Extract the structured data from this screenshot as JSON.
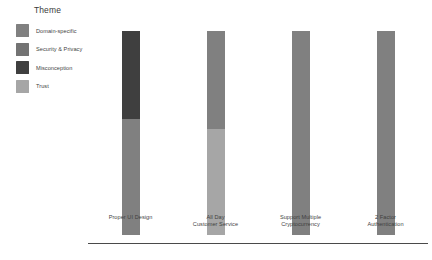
{
  "legend": {
    "title": "Theme",
    "items": [
      {
        "label": "Domain-specific",
        "color": "#808080"
      },
      {
        "label": "Security & Privacy",
        "color": "#737373"
      },
      {
        "label": "Misconception",
        "color": "#3f3f3f"
      },
      {
        "label": "Trust",
        "color": "#a6a6a6"
      }
    ]
  },
  "axis": {
    "line_color": "#4a4a4a"
  },
  "chart_data": {
    "type": "bar",
    "title": "",
    "xlabel": "",
    "ylabel": "",
    "stacked": true,
    "normalized": true,
    "grid": false,
    "legend_position": "top-left",
    "ylim": [
      0,
      100
    ],
    "categories": [
      "Proper UI Design",
      "All Day Customer Service",
      "Support Multiple Cryptocurrency",
      "2 Factor Authentication"
    ],
    "category_lines": [
      [
        "Proper UI Design"
      ],
      [
        "All Day",
        "Customer Service"
      ],
      [
        "Support Multiple",
        "Cryptocurrency"
      ],
      [
        "2 Factor",
        "Authentication"
      ]
    ],
    "series": [
      {
        "name": "Misconception",
        "color": "#3f3f3f",
        "values": [
          43,
          0,
          0,
          0
        ]
      },
      {
        "name": "Domain-specific",
        "color": "#808080",
        "values": [
          57,
          48,
          100,
          100
        ]
      },
      {
        "name": "Trust",
        "color": "#a6a6a6",
        "values": [
          0,
          52,
          0,
          0
        ]
      },
      {
        "name": "Security & Privacy",
        "color": "#737373",
        "values": [
          0,
          0,
          0,
          0
        ]
      }
    ],
    "bars": [
      {
        "category": "Proper UI Design",
        "segments": [
          {
            "theme": "Misconception",
            "value": 43,
            "color": "#3f3f3f"
          },
          {
            "theme": "Domain-specific",
            "value": 57,
            "color": "#808080"
          }
        ]
      },
      {
        "category": "All Day Customer Service",
        "segments": [
          {
            "theme": "Domain-specific",
            "value": 48,
            "color": "#808080"
          },
          {
            "theme": "Trust",
            "value": 52,
            "color": "#a6a6a6"
          }
        ]
      },
      {
        "category": "Support Multiple Cryptocurrency",
        "segments": [
          {
            "theme": "Domain-specific",
            "value": 100,
            "color": "#808080"
          }
        ]
      },
      {
        "category": "2 Factor Authentication",
        "segments": [
          {
            "theme": "Domain-specific",
            "value": 100,
            "color": "#808080"
          }
        ]
      }
    ]
  }
}
